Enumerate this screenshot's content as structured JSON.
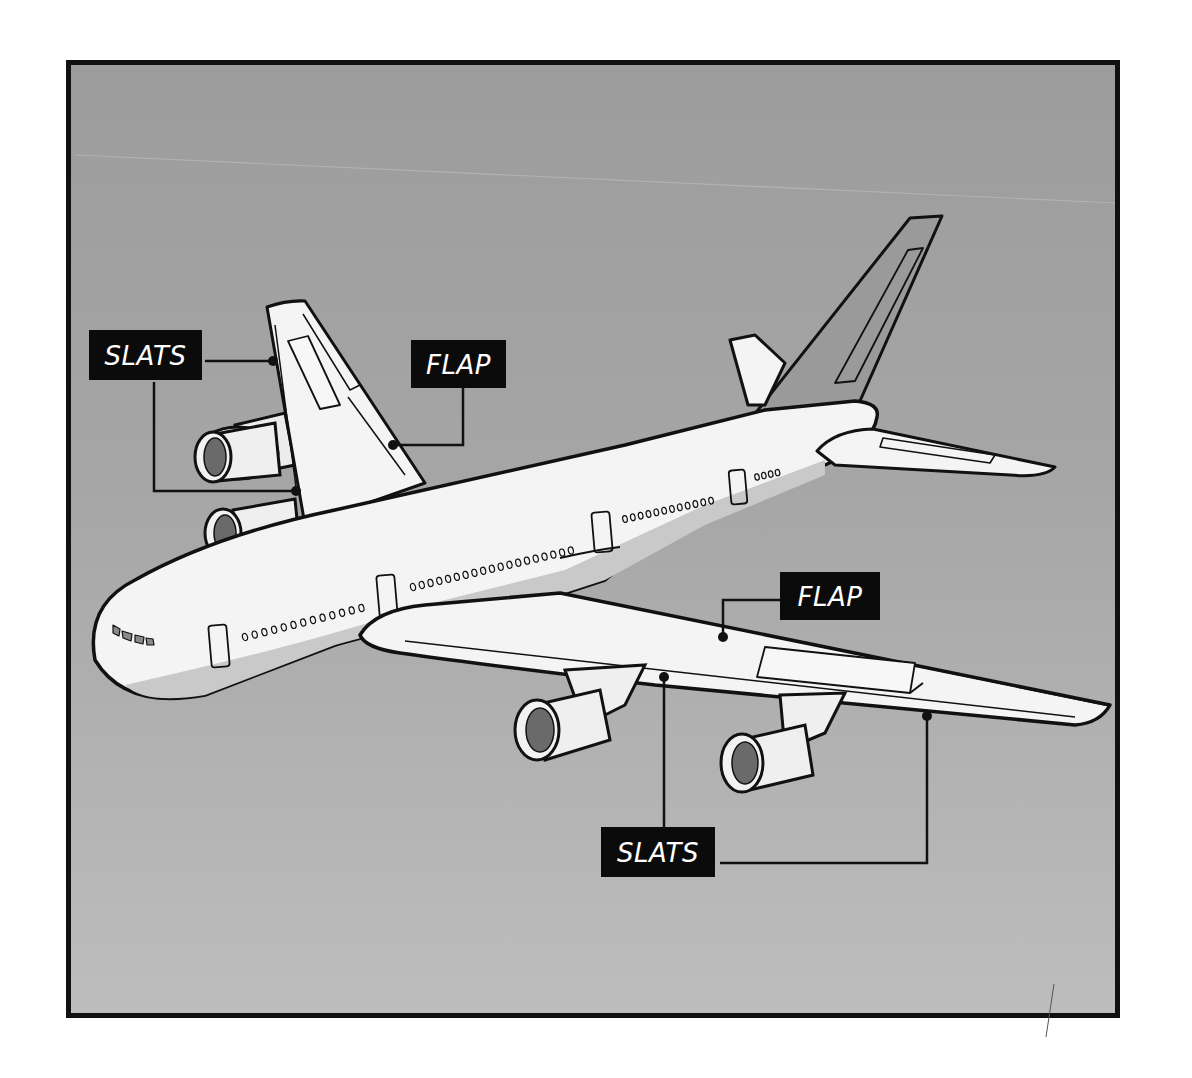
{
  "diagram": {
    "colors": {
      "background": "#a3a3a3",
      "frame_border": "#111111",
      "aircraft_fill": "#f4f4f4",
      "aircraft_shadow": "#c9c9c9",
      "outline": "#111111",
      "label_bg": "#0b0b0b",
      "label_text": "#ffffff"
    },
    "labels": [
      {
        "id": "slats_left",
        "text": "SLATS",
        "points_to": "leading edge of far (left) wing"
      },
      {
        "id": "flap_left",
        "text": "FLAP",
        "points_to": "trailing edge of far (left) wing"
      },
      {
        "id": "flap_right",
        "text": "FLAP",
        "points_to": "trailing edge of near (right) wing"
      },
      {
        "id": "slats_right",
        "text": "SLATS",
        "points_to": "leading edge of near (right) wing"
      }
    ]
  }
}
